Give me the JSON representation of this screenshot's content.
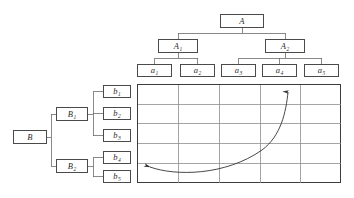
{
  "figure": {
    "colors": {
      "box_border": "#4a4a4a",
      "connector": "#6b6b6b",
      "grid_outer": "#3c3c3c",
      "grid_inner": "#8f8f8f",
      "arrow": "#333333",
      "background": "#ffffff"
    }
  },
  "tree_a": {
    "orientation": "top-down",
    "root": {
      "id": "A",
      "base": "A",
      "sub": ""
    },
    "level2": [
      {
        "id": "A1",
        "base": "A",
        "sub": "1"
      },
      {
        "id": "A2",
        "base": "A",
        "sub": "2"
      }
    ],
    "leaves": [
      {
        "id": "a1",
        "base": "a",
        "sub": "1",
        "parent": "A1"
      },
      {
        "id": "a2",
        "base": "a",
        "sub": "2",
        "parent": "A1"
      },
      {
        "id": "a3",
        "base": "a",
        "sub": "3",
        "parent": "A2"
      },
      {
        "id": "a4",
        "base": "a",
        "sub": "4",
        "parent": "A2"
      },
      {
        "id": "a5",
        "base": "a",
        "sub": "5",
        "parent": "A2"
      }
    ]
  },
  "tree_b": {
    "orientation": "left-right",
    "root": {
      "id": "B",
      "base": "B",
      "sub": ""
    },
    "level2": [
      {
        "id": "B1",
        "base": "B",
        "sub": "1"
      },
      {
        "id": "B2",
        "base": "B",
        "sub": "2"
      }
    ],
    "leaves": [
      {
        "id": "b1",
        "base": "b",
        "sub": "1",
        "parent": "B1"
      },
      {
        "id": "b2",
        "base": "b",
        "sub": "2",
        "parent": "B1"
      },
      {
        "id": "b3",
        "base": "b",
        "sub": "3",
        "parent": "B1"
      },
      {
        "id": "b4",
        "base": "b",
        "sub": "4",
        "parent": "B2"
      },
      {
        "id": "b5",
        "base": "b",
        "sub": "5",
        "parent": "B2"
      }
    ]
  },
  "grid": {
    "columns": 5,
    "rows": 5,
    "column_headers": [
      "a1",
      "a2",
      "a3",
      "a4",
      "a5"
    ],
    "row_headers": [
      "b1",
      "b2",
      "b3",
      "b4",
      "b5"
    ],
    "cells_empty": true
  },
  "annotation": {
    "arrow": {
      "type": "double-headed-curve",
      "from_cell": {
        "column": 1,
        "row": 5
      },
      "to_cell": {
        "column": 4,
        "row": 1
      },
      "head_start_direction": "left",
      "head_end_direction": "up"
    }
  }
}
